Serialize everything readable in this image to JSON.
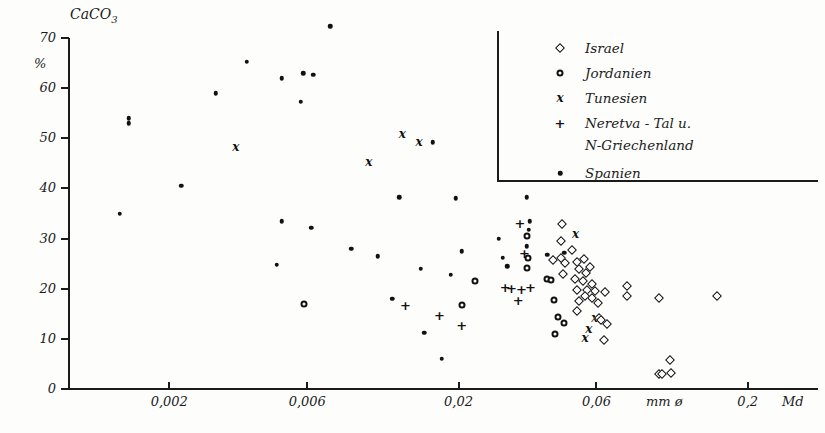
{
  "axes": {
    "y_title": "CaCO",
    "y_title_sub": "3",
    "y_unit": "%",
    "y_ticks": [
      "0",
      "10",
      "20",
      "30",
      "40",
      "50",
      "60",
      "70"
    ],
    "x_ticks": [
      "0,002",
      "0,006",
      "0,02",
      "0,06",
      "0,2"
    ],
    "x_annotation_unit": "mm ø",
    "x_annotation_md": "Md"
  },
  "legend": {
    "entries": [
      {
        "label": "Israel",
        "marker": "diamond"
      },
      {
        "label": "Jordanien",
        "marker": "circle"
      },
      {
        "label": "Tunesien",
        "marker": "x"
      },
      {
        "label": "Neretva - Tal u.",
        "label2": "N-Griechenland",
        "marker": "plus"
      },
      {
        "label": "Spanien",
        "marker": "dot"
      }
    ]
  },
  "chart_data": {
    "type": "scatter",
    "title": "",
    "xlabel": "mm ø (Md)",
    "ylabel": "CaCO3 %",
    "xscale": "log",
    "ylim": [
      0,
      70
    ],
    "xlim": [
      0.0009,
      0.35
    ],
    "grid": false,
    "legend_position": "top-right",
    "xtick_values": [
      0.002,
      0.006,
      0.02,
      0.06,
      0.2
    ],
    "ytick_values": [
      0,
      10,
      20,
      30,
      40,
      50,
      60,
      70
    ],
    "series": [
      {
        "name": "Spanien",
        "marker": "dot",
        "points": [
          [
            0.00145,
            54.0
          ],
          [
            0.00145,
            53.0
          ],
          [
            0.00135,
            35.0
          ],
          [
            0.0022,
            40.5
          ],
          [
            0.0029,
            59.0
          ],
          [
            0.0037,
            65.3
          ],
          [
            0.0049,
            62.0
          ],
          [
            0.0058,
            63.0
          ],
          [
            0.0063,
            62.7
          ],
          [
            0.0057,
            57.3
          ],
          [
            0.0049,
            33.5
          ],
          [
            0.0072,
            72.3
          ],
          [
            0.0047,
            24.8
          ],
          [
            0.0062,
            32.2
          ],
          [
            0.0085,
            28.0
          ],
          [
            0.0105,
            26.5
          ],
          [
            0.0125,
            38.2
          ],
          [
            0.0118,
            18.0
          ],
          [
            0.0148,
            24.0
          ],
          [
            0.0163,
            49.2
          ],
          [
            0.0152,
            11.2
          ],
          [
            0.0175,
            6.0
          ],
          [
            0.0196,
            38.0
          ],
          [
            0.0205,
            27.5
          ],
          [
            0.0188,
            22.8
          ],
          [
            0.0275,
            30.0
          ],
          [
            0.0285,
            26.2
          ],
          [
            0.0295,
            24.5
          ],
          [
            0.0345,
            38.2
          ],
          [
            0.0352,
            33.5
          ],
          [
            0.035,
            31.8
          ],
          [
            0.0345,
            28.5
          ],
          [
            0.0405,
            26.8
          ],
          [
            0.0465,
            27.2
          ]
        ]
      },
      {
        "name": "Jordanien",
        "marker": "circle",
        "points": [
          [
            0.00585,
            17.0
          ],
          [
            0.0205,
            16.7
          ],
          [
            0.0228,
            21.5
          ],
          [
            0.0345,
            30.5
          ],
          [
            0.0348,
            26.2
          ],
          [
            0.0346,
            24.2
          ],
          [
            0.0405,
            22.0
          ],
          [
            0.0428,
            17.8
          ],
          [
            0.0442,
            14.3
          ],
          [
            0.0465,
            13.2
          ],
          [
            0.0432,
            11.0
          ],
          [
            0.0418,
            21.7
          ]
        ]
      },
      {
        "name": "Tunesien",
        "marker": "x",
        "points": [
          [
            0.0034,
            48.3
          ],
          [
            0.0098,
            45.3
          ],
          [
            0.0128,
            50.8
          ],
          [
            0.0146,
            49.3
          ],
          [
            0.0508,
            31.0
          ],
          [
            0.0592,
            14.2
          ],
          [
            0.0565,
            12.0
          ],
          [
            0.0548,
            10.2
          ]
        ]
      },
      {
        "name": "Neretva-Tal u. N-Griechenland",
        "marker": "plus",
        "points": [
          [
            0.0131,
            16.8
          ],
          [
            0.0172,
            14.8
          ],
          [
            0.0205,
            12.8
          ],
          [
            0.0326,
            33.2
          ],
          [
            0.0338,
            27.2
          ],
          [
            0.0305,
            20.2
          ],
          [
            0.033,
            20.0
          ],
          [
            0.0355,
            20.4
          ],
          [
            0.0322,
            17.8
          ],
          [
            0.029,
            20.3
          ]
        ]
      },
      {
        "name": "Israel",
        "marker": "diamond",
        "points": [
          [
            0.0425,
            25.8
          ],
          [
            0.0455,
            33.0
          ],
          [
            0.0452,
            29.5
          ],
          [
            0.0452,
            26.2
          ],
          [
            0.0458,
            23.0
          ],
          [
            0.0468,
            25.2
          ],
          [
            0.0495,
            27.8
          ],
          [
            0.0512,
            25.3
          ],
          [
            0.0522,
            24.0
          ],
          [
            0.0545,
            26.0
          ],
          [
            0.0553,
            23.2
          ],
          [
            0.0538,
            21.5
          ],
          [
            0.0505,
            22.0
          ],
          [
            0.0512,
            19.8
          ],
          [
            0.052,
            17.5
          ],
          [
            0.0558,
            19.8
          ],
          [
            0.0572,
            24.3
          ],
          [
            0.0578,
            21.0
          ],
          [
            0.0512,
            15.5
          ],
          [
            0.0548,
            18.5
          ],
          [
            0.0578,
            18.2
          ],
          [
            0.0592,
            19.6
          ],
          [
            0.0608,
            17.2
          ],
          [
            0.0612,
            14.2
          ],
          [
            0.062,
            13.8
          ],
          [
            0.064,
            19.3
          ],
          [
            0.0652,
            13.0
          ],
          [
            0.0635,
            9.8
          ],
          [
            0.0762,
            20.5
          ],
          [
            0.0768,
            18.6
          ],
          [
            0.0985,
            18.2
          ],
          [
            0.156,
            18.6
          ],
          [
            0.108,
            5.8
          ],
          [
            0.1085,
            3.2
          ],
          [
            0.0985,
            2.9
          ],
          [
            0.1012,
            2.9
          ]
        ]
      }
    ]
  }
}
